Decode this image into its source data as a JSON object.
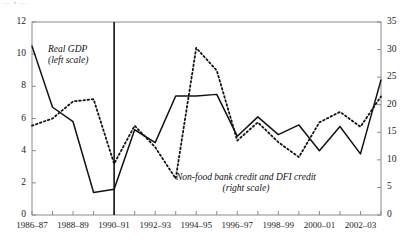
{
  "top_fragment": "— ▪ —",
  "annotations": {
    "series1_line1": "Real GDP",
    "series1_line2": "(left scale)",
    "series2_line1": "Non-food bank credit and DFI credit",
    "series2_line2": "(right scale)"
  },
  "axis": {
    "left_ticks": [
      "12",
      "10",
      "8",
      "6",
      "4",
      "2",
      "0"
    ],
    "right_ticks": [
      "35",
      "30",
      "25",
      "20",
      "15",
      "10",
      "5",
      "0"
    ],
    "x_labels": [
      "1986–87",
      "1988–89",
      "1990–91",
      "1992–93",
      "1994–95",
      "1996–97",
      "1998–99",
      "2000–01",
      "2002–03"
    ]
  },
  "colors": {
    "line": "#111111",
    "axis": "#8a8a8a",
    "text": "#1a1a1a"
  },
  "chart_data": {
    "type": "line",
    "title": "",
    "xlabel": "",
    "ylabel": "",
    "grid": false,
    "legend_position": "inline-annotation",
    "x": [
      "1986-87",
      "1987-88",
      "1988-89",
      "1989-90",
      "1990-91",
      "1991-92",
      "1992-93",
      "1993-94",
      "1994-95",
      "1995-96",
      "1996-97",
      "1997-98",
      "1998-99",
      "1999-00",
      "2000-01",
      "2001-02",
      "2002-03",
      "2003-04"
    ],
    "x_tick_labels": [
      "1986–87",
      "1988–89",
      "1990–91",
      "1992–93",
      "1994–95",
      "1996–97",
      "1998–99",
      "2000–01",
      "2002–03"
    ],
    "vertical_marker_x": "1990-91",
    "series": [
      {
        "name": "Real GDP",
        "scale": "left",
        "style": "solid",
        "ylim": [
          0,
          12
        ],
        "yticks": [
          0,
          2,
          4,
          6,
          8,
          10,
          12
        ],
        "values": [
          10.5,
          6.7,
          5.8,
          1.4,
          1.6,
          5.3,
          4.5,
          7.4,
          7.4,
          7.5,
          4.9,
          6.1,
          5.0,
          5.6,
          4.0,
          5.5,
          3.8,
          8.4
        ]
      },
      {
        "name": "Non-food bank credit and DFI credit",
        "scale": "right",
        "style": "dotted",
        "ylim": [
          0,
          35
        ],
        "yticks": [
          0,
          5,
          10,
          15,
          20,
          25,
          30,
          35
        ],
        "values": [
          16.2,
          17.5,
          20.6,
          21.0,
          9.3,
          16.2,
          12.3,
          6.6,
          30.3,
          26.2,
          13.5,
          16.8,
          13.2,
          10.5,
          16.8,
          18.7,
          16.0,
          21.5
        ]
      }
    ]
  }
}
